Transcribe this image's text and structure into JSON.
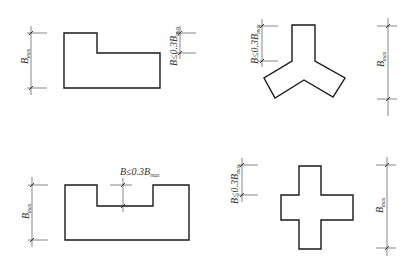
{
  "diagram": {
    "title": "",
    "labels": {
      "b_max_main": "B",
      "b_max_sub": "max",
      "b_limit_main": "B≤0.3B",
      "b_limit_sub": "max"
    },
    "panels": [
      {
        "id": "l-shape",
        "shape": "L-shaped plan",
        "dims": [
          "B_max",
          "B≤0.3B_max"
        ]
      },
      {
        "id": "y-shape",
        "shape": "Y-shaped (three-arm) plan",
        "dims": [
          "B≤0.3B_max",
          "B_max"
        ]
      },
      {
        "id": "u-shape",
        "shape": "U-shaped (notched) plan",
        "dims": [
          "B_max",
          "B≤0.3B_max"
        ]
      },
      {
        "id": "cross-shape",
        "shape": "Cross-shaped plan",
        "dims": [
          "B≤0.3B_max",
          "B_max"
        ]
      }
    ],
    "colors": {
      "line": "#1a1a1a",
      "dim_line": "#555555",
      "background": "#ffffff"
    }
  }
}
